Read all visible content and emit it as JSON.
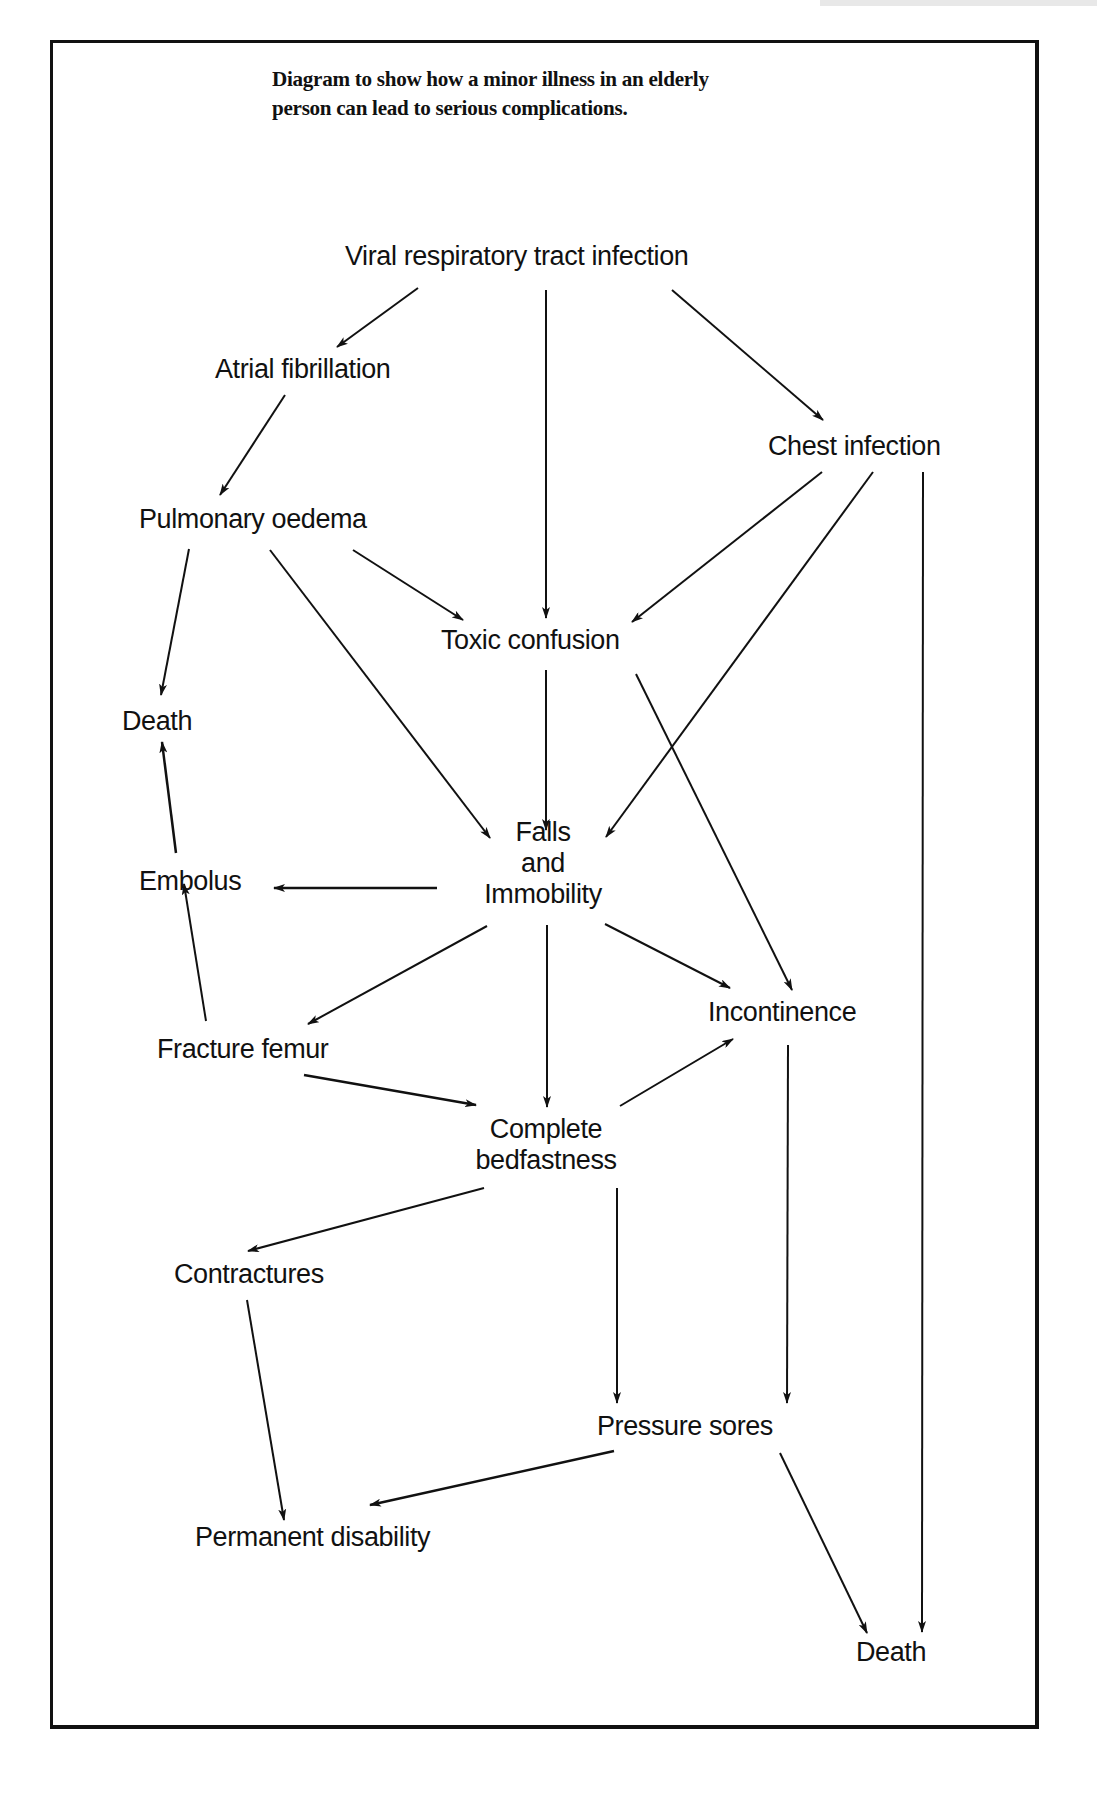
{
  "page": {
    "header_strip": "",
    "title_lines": [
      "Diagram to show how a minor illness in an elderly",
      "person can lead to serious complications."
    ]
  },
  "nodes": {
    "viral": {
      "label": "Viral respiratory tract infection"
    },
    "atrial": {
      "label": "Atrial fibrillation"
    },
    "chest": {
      "label": "Chest infection"
    },
    "pulmonary": {
      "label": "Pulmonary oedema"
    },
    "toxic": {
      "label": "Toxic confusion"
    },
    "death_left": {
      "label": "Death"
    },
    "falls": {
      "lines": [
        "Falls",
        "and",
        "Immobility"
      ]
    },
    "embolus": {
      "label": "Embolus"
    },
    "incontinence": {
      "label": "Incontinence"
    },
    "fracture": {
      "label": "Fracture femur"
    },
    "bedfast": {
      "lines": [
        "Complete",
        "bedfastness"
      ]
    },
    "contractures": {
      "label": "Contractures"
    },
    "pressure": {
      "label": "Pressure sores"
    },
    "permanent": {
      "label": "Permanent disability"
    },
    "death_right": {
      "label": "Death"
    }
  },
  "edges": [
    {
      "from": "Viral respiratory tract infection",
      "to": "Atrial fibrillation"
    },
    {
      "from": "Viral respiratory tract infection",
      "to": "Toxic confusion"
    },
    {
      "from": "Viral respiratory tract infection",
      "to": "Chest infection"
    },
    {
      "from": "Atrial fibrillation",
      "to": "Pulmonary oedema"
    },
    {
      "from": "Chest infection",
      "to": "Toxic confusion"
    },
    {
      "from": "Chest infection",
      "to": "Falls and Immobility"
    },
    {
      "from": "Chest infection",
      "to": "Death"
    },
    {
      "from": "Pulmonary oedema",
      "to": "Death"
    },
    {
      "from": "Pulmonary oedema",
      "to": "Toxic confusion"
    },
    {
      "from": "Pulmonary oedema",
      "to": "Falls and Immobility"
    },
    {
      "from": "Toxic confusion",
      "to": "Falls and Immobility"
    },
    {
      "from": "Toxic confusion",
      "to": "Incontinence"
    },
    {
      "from": "Embolus",
      "to": "Death"
    },
    {
      "from": "Falls and Immobility",
      "to": "Embolus"
    },
    {
      "from": "Falls and Immobility",
      "to": "Fracture femur"
    },
    {
      "from": "Falls and Immobility",
      "to": "Complete bedfastness"
    },
    {
      "from": "Falls and Immobility",
      "to": "Incontinence"
    },
    {
      "from": "Fracture femur",
      "to": "Embolus"
    },
    {
      "from": "Fracture femur",
      "to": "Complete bedfastness"
    },
    {
      "from": "Complete bedfastness",
      "to": "Incontinence"
    },
    {
      "from": "Complete bedfastness",
      "to": "Contractures"
    },
    {
      "from": "Complete bedfastness",
      "to": "Pressure sores"
    },
    {
      "from": "Incontinence",
      "to": "Pressure sores"
    },
    {
      "from": "Contractures",
      "to": "Permanent disability"
    },
    {
      "from": "Pressure sores",
      "to": "Permanent disability"
    },
    {
      "from": "Pressure sores",
      "to": "Death"
    }
  ],
  "colors": {
    "ink": "#111111",
    "background": "#ffffff"
  }
}
